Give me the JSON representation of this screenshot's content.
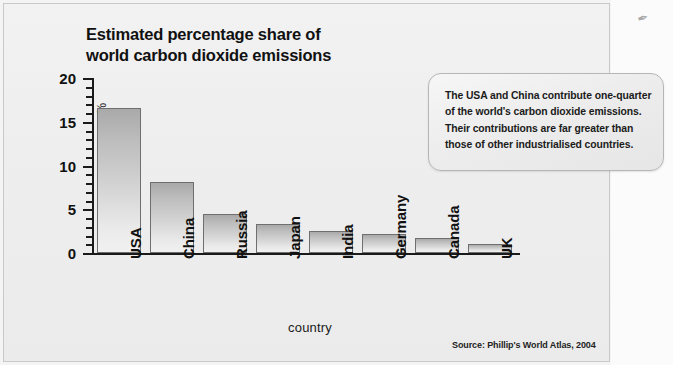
{
  "figure": {
    "title_line1": "Estimated percentage share of",
    "title_line2": "world carbon dioxide emissions",
    "source": "Source: Phillip's World Atlas, 2004",
    "corner_mark": "✒"
  },
  "callout": {
    "text": "The USA and China contribute one-quarter of the world's carbon dioxide emissions. Their contributions are far greater than those of other industrialised countries."
  },
  "chart_data": {
    "type": "bar",
    "title": "Estimated percentage share of world carbon dioxide emissions",
    "xlabel": "country",
    "ylabel": "percentage %",
    "categories": [
      "USA",
      "China",
      "Russia",
      "Japan",
      "India",
      "Germany",
      "Canada",
      "UK"
    ],
    "values": [
      16.6,
      8.1,
      4.5,
      3.3,
      2.5,
      2.2,
      1.7,
      1.0
    ],
    "ylim": [
      0,
      20
    ],
    "ytick_labels": [
      "0",
      "5",
      "10",
      "15",
      "20"
    ],
    "ytick_values": [
      0,
      5,
      10,
      15,
      20
    ],
    "minor_tick_step": 1,
    "grid": false,
    "legend": false,
    "bar_fill_top": "#a9a9a9",
    "bar_fill_bottom": "#f1f1f1",
    "bar_edge": "#6f6f6f",
    "axis_color": "#1a1a1a",
    "background": "#eeeeee"
  }
}
